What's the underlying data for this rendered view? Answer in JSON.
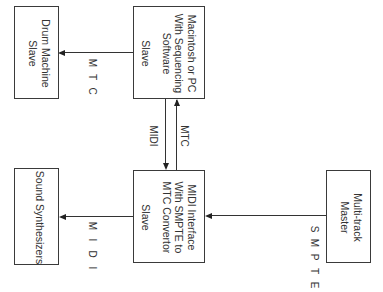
{
  "diagram": {
    "orientation": "rotated 90deg clockwise",
    "nodes": [
      {
        "id": "multitrack",
        "lines": [
          "Multi-track",
          "Master"
        ]
      },
      {
        "id": "midi_interface",
        "lines": [
          "MIDI Interface",
          "With SMPTE to",
          "MTC Convertor",
          "",
          "Slave"
        ]
      },
      {
        "id": "computer",
        "lines": [
          "Macintosh or PC",
          "With Sequencing",
          "Software",
          "",
          "Slave"
        ]
      },
      {
        "id": "drum_machine",
        "lines": [
          "Drum Machine",
          "Slave"
        ]
      },
      {
        "id": "synths",
        "lines": [
          "Sound Synthesizers"
        ]
      }
    ],
    "edges": [
      {
        "from": "multitrack",
        "to": "midi_interface",
        "label": "SMPTE",
        "letters": [
          "S",
          "M",
          "P",
          "T",
          "E"
        ]
      },
      {
        "from": "midi_interface",
        "to": "computer",
        "label": "MTC"
      },
      {
        "from": "computer",
        "to": "midi_interface",
        "label": "MIDI"
      },
      {
        "from": "computer",
        "to": "drum_machine",
        "label": "MTC",
        "letters": [
          "M",
          "T",
          "C"
        ]
      },
      {
        "from": "midi_interface",
        "to": "synths",
        "label": "MIDI",
        "letters": [
          "M",
          "I",
          "D",
          "I"
        ]
      }
    ]
  }
}
